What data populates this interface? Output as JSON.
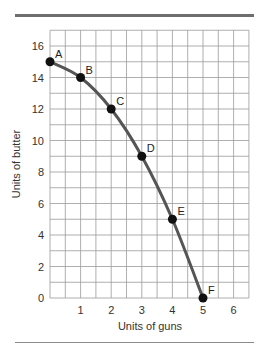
{
  "chart_data": {
    "type": "line",
    "title": "",
    "xlabel": "Units of guns",
    "ylabel": "Units of butter",
    "xlim": [
      0,
      6.5
    ],
    "ylim": [
      0,
      17
    ],
    "grid": true,
    "x_ticks": [
      1,
      2,
      3,
      4,
      5,
      6
    ],
    "y_ticks": [
      0,
      2,
      4,
      6,
      8,
      10,
      12,
      14,
      16
    ],
    "series": [
      {
        "name": "Production possibilities frontier",
        "color": "#555555",
        "points": [
          {
            "label": "A",
            "x": 0,
            "y": 15
          },
          {
            "label": "B",
            "x": 1,
            "y": 14
          },
          {
            "label": "C",
            "x": 2,
            "y": 12
          },
          {
            "label": "D",
            "x": 3,
            "y": 9
          },
          {
            "label": "E",
            "x": 4,
            "y": 5
          },
          {
            "label": "F",
            "x": 5,
            "y": 0
          }
        ]
      }
    ],
    "legend": null
  },
  "labels": {
    "xlabel": "Units of guns",
    "ylabel": "Units of butter"
  }
}
